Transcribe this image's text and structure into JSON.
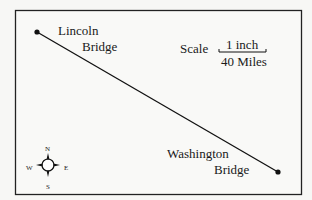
{
  "map": {
    "places": [
      {
        "name_line1": "Lincoln",
        "name_line2": "Bridge"
      },
      {
        "name_line1": "Washington",
        "name_line2": "Bridge"
      }
    ],
    "scale": {
      "label": "Scale",
      "map_distance": "1 inch",
      "real_distance": "40 Miles"
    },
    "compass": {
      "north": "N",
      "south": "S",
      "east": "E",
      "west": "W"
    }
  }
}
